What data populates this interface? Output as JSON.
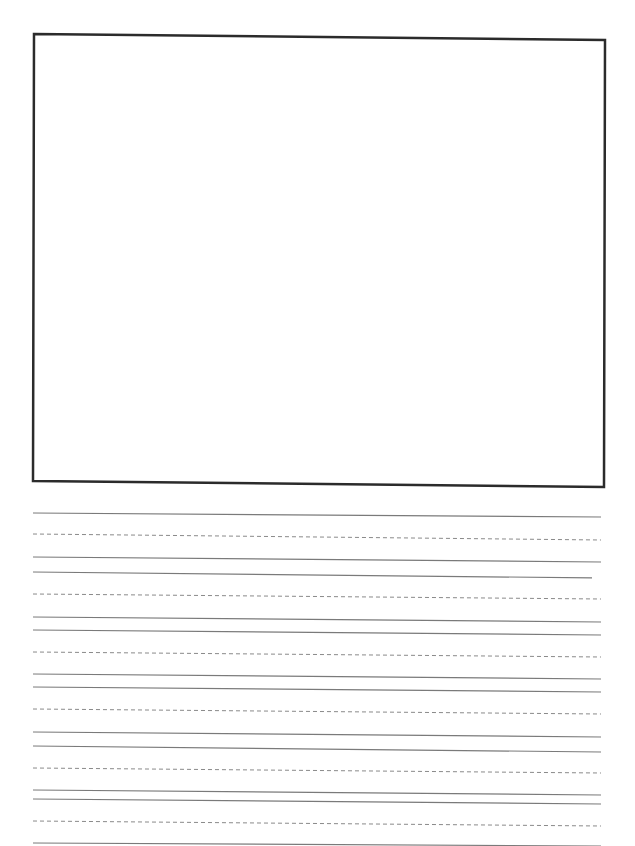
{
  "page": {
    "type": "handwriting-practice-sheet",
    "background": "#ffffff"
  },
  "drawing_box": {
    "corners": {
      "top_left": [
        34,
        34
      ],
      "top_right": [
        605,
        40
      ],
      "bottom_right": [
        604,
        487
      ],
      "bottom_left": [
        33,
        481
      ]
    },
    "stroke": "#2b2b2b",
    "stroke_width": 2.5
  },
  "ruling": {
    "x_start": 33,
    "x_end": 601,
    "solid_color": "#7a7a7a",
    "dashed_color": "#8a8a8a",
    "lines": [
      {
        "style": "solid",
        "y_left": 513,
        "y_right": 517
      },
      {
        "style": "dashed",
        "y_left": 534,
        "y_right": 540
      },
      {
        "style": "solid",
        "y_left": 557,
        "y_right": 562
      },
      {
        "style": "solid",
        "y_left": 572,
        "y_right": 578,
        "x_end": 592
      },
      {
        "style": "dashed",
        "y_left": 594,
        "y_right": 599
      },
      {
        "style": "solid",
        "y_left": 617,
        "y_right": 622
      },
      {
        "style": "solid",
        "y_left": 630,
        "y_right": 635
      },
      {
        "style": "dashed",
        "y_left": 652,
        "y_right": 657
      },
      {
        "style": "solid",
        "y_left": 674,
        "y_right": 679
      },
      {
        "style": "solid",
        "y_left": 687,
        "y_right": 692
      },
      {
        "style": "dashed",
        "y_left": 709,
        "y_right": 714
      },
      {
        "style": "solid",
        "y_left": 732,
        "y_right": 737
      },
      {
        "style": "solid",
        "y_left": 746,
        "y_right": 752
      },
      {
        "style": "dashed",
        "y_left": 768,
        "y_right": 773
      },
      {
        "style": "solid",
        "y_left": 790,
        "y_right": 795
      },
      {
        "style": "solid",
        "y_left": 799,
        "y_right": 804
      },
      {
        "style": "dashed",
        "y_left": 821,
        "y_right": 826
      },
      {
        "style": "solid",
        "y_left": 843,
        "y_right": 846
      }
    ]
  }
}
